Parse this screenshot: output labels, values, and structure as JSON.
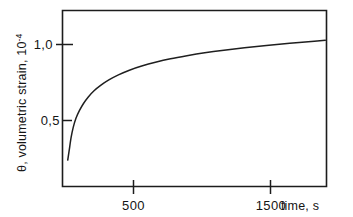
{
  "chart_data": {
    "type": "line",
    "title": "",
    "subtitle": "",
    "xlabel": "time, s",
    "ylabel": "θ, volumetric strain, 10⁻⁴",
    "ylabel_parts": {
      "main": "θ, volumetric strain, 10",
      "exponent": "-4"
    },
    "xlim": [
      0,
      1930
    ],
    "ylim": [
      0.18,
      1.26
    ],
    "xticks": [
      500,
      1500
    ],
    "xtick_labels": [
      "500",
      "1500"
    ],
    "yticks": [
      0.5,
      1.0
    ],
    "ytick_labels": [
      "0,5",
      "1,0"
    ],
    "grid": false,
    "legend": null,
    "frame": "box",
    "series": [
      {
        "name": "volumetric strain",
        "color": "#1f1f1f",
        "x": [
          20,
          30,
          45,
          60,
          80,
          105,
          135,
          170,
          210,
          260,
          320,
          390,
          470,
          560,
          660,
          770,
          890,
          1020,
          1160,
          1310,
          1470,
          1640,
          1820,
          1900
        ],
        "y": [
          0.24,
          0.3,
          0.39,
          0.455,
          0.515,
          0.565,
          0.612,
          0.655,
          0.694,
          0.731,
          0.767,
          0.8,
          0.831,
          0.858,
          0.883,
          0.906,
          0.926,
          0.945,
          0.962,
          0.978,
          0.993,
          1.008,
          1.022,
          1.028
        ]
      }
    ],
    "annotations": []
  },
  "axis_labels": {
    "x_tick_500": "500",
    "x_tick_1500": "1500",
    "x_axis_name": "time, s",
    "y_tick_05": "0,5",
    "y_tick_10": "1,0",
    "y_axis_name_main": "θ, volumetric strain, 10",
    "y_axis_name_exponent": "-4"
  },
  "colors": {
    "curve": "#1f1f1f",
    "axis": "#1c1c1c",
    "text": "#151515",
    "background": "#ffffff"
  }
}
